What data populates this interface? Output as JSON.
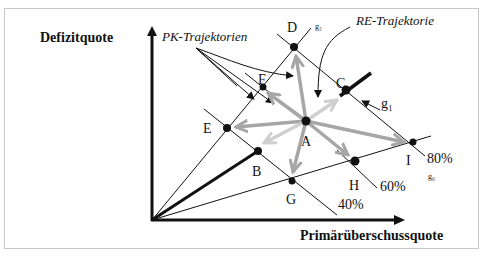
{
  "diagram": {
    "axes": {
      "y_label": "Defizitquote",
      "x_label": "Primärüberschussquote"
    },
    "annotations": {
      "pk": "PK-Trajektorien",
      "re": "RE-Trajektorie"
    },
    "lines": {
      "g0": "g₀",
      "g1": "g₁",
      "g2": "g₂"
    },
    "percent_lines": [
      "40%",
      "60%",
      "80%"
    ],
    "points": {
      "A": "A",
      "B": "B",
      "C": "C",
      "D": "D",
      "E": "E",
      "F": "F",
      "G": "G",
      "H": "H",
      "I": "I"
    },
    "colors": {
      "arrow_gray": "#a6a6a6",
      "arrow_light": "#cfcfcf",
      "line": "#111111"
    }
  }
}
